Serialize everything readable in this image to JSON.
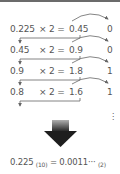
{
  "diagram": {
    "steps": [
      {
        "operand": "0.225",
        "operation": "× 2 =",
        "result": "0.45",
        "bit": "0"
      },
      {
        "operand": "0.45",
        "operation": "× 2 =",
        "result": "0.9",
        "bit": "0"
      },
      {
        "operand": "0.9",
        "operation": "× 2 =",
        "result": "1.8",
        "bit": "1"
      },
      {
        "operand": "0.8",
        "operation": "× 2 =",
        "result": "1.6",
        "bit": "1"
      }
    ],
    "continuation": "⋮",
    "conclusion": {
      "lhs": "0.225",
      "lhs_base": "(10)",
      "equals": "=",
      "rhs": "0.0011···",
      "rhs_base": "(2)"
    },
    "colors": {
      "text": "#555555",
      "lines": "#666666",
      "big_arrow_top": "#a8a8a8",
      "big_arrow_bottom": "#222222",
      "top_border": "#6b6b6b"
    }
  }
}
